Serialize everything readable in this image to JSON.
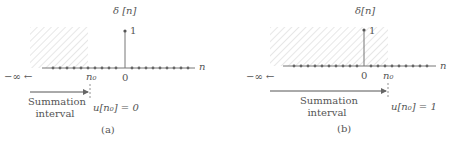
{
  "panels": [
    {
      "id": "a",
      "caption": "(a)",
      "title": "δ [n]",
      "stem_value_label": "1",
      "axis_label": "n",
      "zero_label": "0",
      "n0_label": "n₀",
      "neg_inf_label": "−∞ ←",
      "summation_line1": "Summation",
      "summation_line2": "interval",
      "result_label": "u[n₀] = 0",
      "n0_relative_to_zero": "negative"
    },
    {
      "id": "b",
      "caption": "(b)",
      "title": "δ[n]",
      "stem_value_label": "1",
      "axis_label": "n",
      "zero_label": "0",
      "n0_label": "n₀",
      "neg_inf_label": "−∞ ←",
      "summation_line1": "Summation",
      "summation_line2": "interval",
      "result_label": "u[n₀] = 1",
      "n0_relative_to_zero": "positive"
    }
  ],
  "colors": {
    "line": "#777777",
    "hatch": "#d8d8d8",
    "text": "#555555"
  }
}
